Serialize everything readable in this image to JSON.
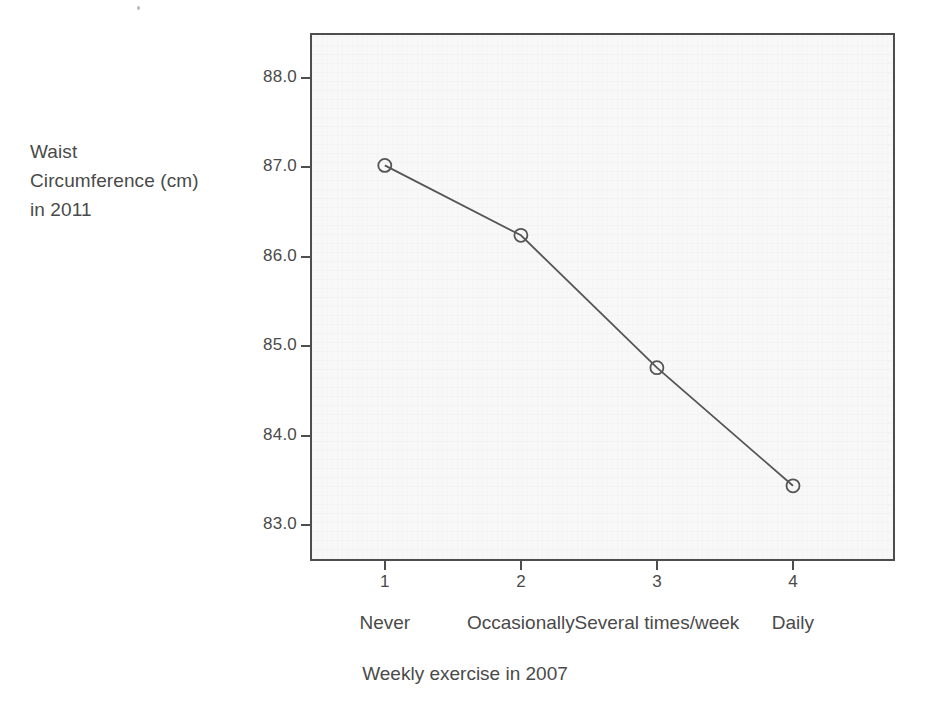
{
  "chart_data": {
    "type": "line",
    "title": "",
    "subtitle": "",
    "xlabel": "Weekly exercise in 2007",
    "ylabel": "Waist Circumference (cm) in 2011",
    "ylabel_lines": [
      "Waist",
      "Circumference (cm)",
      "in 2011"
    ],
    "x": [
      1,
      2,
      3,
      4
    ],
    "categories": [
      "Never",
      "Occasionally",
      "Several times/week",
      "Daily"
    ],
    "values": [
      87.02,
      86.24,
      84.76,
      83.44
    ],
    "series": [
      {
        "name": "Mean waist circumference",
        "values": [
          87.02,
          86.24,
          84.76,
          83.44
        ]
      }
    ],
    "x_tick_labels": [
      "1",
      "2",
      "3",
      "4"
    ],
    "y_tick_labels": [
      "88.0",
      "87.0",
      "86.0",
      "85.0",
      "84.0",
      "83.0"
    ],
    "y_ticks": [
      88.0,
      87.0,
      86.0,
      85.0,
      84.0,
      83.0
    ],
    "ylim": [
      82.6,
      88.5
    ],
    "xlim": [
      0.45,
      4.75
    ],
    "grid": false,
    "legend": "none",
    "marker": "open-circle",
    "line_color": "#555555",
    "marker_color": "#555555",
    "panel_background": "#f8f8f8",
    "frame_color": "#4d4d4d",
    "text_color": "#4a4a4a"
  },
  "axes": {
    "y_title_line1": "Waist",
    "y_title_line2": "Circumference (cm)",
    "y_title_line3": "in 2011",
    "x_title": "Weekly exercise in 2007"
  }
}
